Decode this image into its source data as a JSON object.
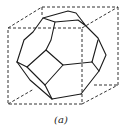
{
  "figure": {
    "caption": "(a)",
    "colors": {
      "background": "#ffffff",
      "line": "#1a1a1a",
      "dashed_line": "#333333"
    },
    "cube": {
      "style": "dashed",
      "front_face": [
        [
          8,
          28
        ],
        [
          82,
          28
        ],
        [
          82,
          104
        ],
        [
          8,
          104
        ]
      ],
      "back_face": [
        [
          42,
          7
        ],
        [
          118,
          7
        ],
        [
          118,
          85
        ],
        [
          42,
          85
        ]
      ]
    },
    "polyhedron": {
      "style": "solid",
      "faces_visible": [
        "top-hexagon",
        "center-square",
        "left-hexagon",
        "right-hexagon",
        "bottom-hexagon",
        "left-sliver-square"
      ]
    }
  }
}
